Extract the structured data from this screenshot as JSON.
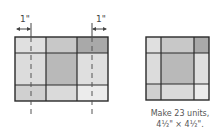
{
  "diagram": {
    "left_block": {
      "x": 15,
      "y": 37,
      "width": 93,
      "height": 64,
      "col_lines": [
        46,
        77
      ],
      "row_lines": [
        53,
        85
      ],
      "cells": [
        [
          "#e0e0e0",
          "#c8c8c8",
          "#a9a9a9"
        ],
        [
          "#dcdcdc",
          "#b9b9b9",
          "#dfdfdf"
        ],
        [
          "#d0d0d0",
          "#dadada",
          "#ececec"
        ]
      ],
      "cut_lines": [
        31,
        92
      ],
      "cut_line_bottom": 116
    },
    "measurements": [
      {
        "label": "1\"",
        "x_from": 16,
        "x_to": 31,
        "label_x": 22,
        "tick_x": 31
      },
      {
        "label": "1\"",
        "x_from": 92,
        "x_to": 107,
        "label_x": 98,
        "tick_x": 92
      }
    ],
    "right_block": {
      "x": 146,
      "y": 37,
      "width": 63,
      "height": 63,
      "col_lines": [
        161,
        194
      ],
      "row_lines": [
        53,
        84
      ],
      "cells": [
        [
          "#e0e0e0",
          "#c8c8c8",
          "#a9a9a9"
        ],
        [
          "#dcdcdc",
          "#b9b9b9",
          "#dfdfdf"
        ],
        [
          "#d0d0d0",
          "#dadada",
          "#ececec"
        ]
      ]
    },
    "colors": {
      "outline": "#2a2a2a",
      "dash": "#555555",
      "text": "#555555"
    }
  },
  "caption": {
    "line1": "Make 23 units,",
    "line2": "4½\" × 4½\"."
  },
  "labels": {
    "left_measure": "1\"",
    "right_measure": "1\""
  }
}
